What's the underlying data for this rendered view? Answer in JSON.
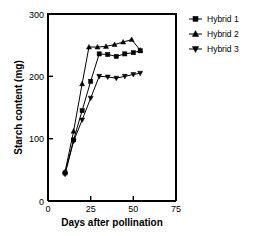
{
  "chart_data": {
    "type": "line",
    "title": "",
    "xlabel": "Days after pollination",
    "ylabel": "Starch content (mg)",
    "xlim": [
      0,
      75
    ],
    "ylim": [
      0,
      300
    ],
    "xticks": [
      0,
      25,
      50,
      75
    ],
    "yticks": [
      0,
      100,
      200,
      300
    ],
    "xtick_labels": [
      "0",
      "25",
      "50",
      "75"
    ],
    "ytick_labels": [
      "0",
      "100",
      "200",
      "300"
    ],
    "grid": false,
    "legend_position": "right",
    "series": [
      {
        "name": "Hybrid 1",
        "marker": "square",
        "x": [
          10,
          15,
          20,
          25,
          30,
          35,
          40,
          45,
          50,
          54
        ],
        "y": [
          45,
          98,
          145,
          192,
          236,
          235,
          232,
          236,
          238,
          241
        ]
      },
      {
        "name": "Hybrid 2",
        "marker": "triangle-up",
        "x": [
          10,
          15,
          20,
          24,
          29,
          34,
          39,
          44,
          49,
          54
        ],
        "y": [
          47,
          112,
          188,
          247,
          247,
          248,
          251,
          255,
          259,
          242
        ]
      },
      {
        "name": "Hybrid 3",
        "marker": "triangle-down",
        "x": [
          10,
          15,
          20,
          25,
          30,
          35,
          40,
          45,
          50,
          54
        ],
        "y": [
          43,
          96,
          130,
          165,
          200,
          199,
          197,
          200,
          203,
          205
        ]
      }
    ]
  },
  "legend": {
    "entries": [
      {
        "label": "Hybrid 1"
      },
      {
        "label": "Hybrid 2"
      },
      {
        "label": "Hybrid 3"
      }
    ]
  },
  "axes": {
    "x_title": "Days after pollination",
    "y_title": "Starch content (mg)",
    "x_labels": [
      "0",
      "25",
      "50",
      "75"
    ],
    "y_labels": [
      "0",
      "100",
      "200",
      "300"
    ]
  }
}
